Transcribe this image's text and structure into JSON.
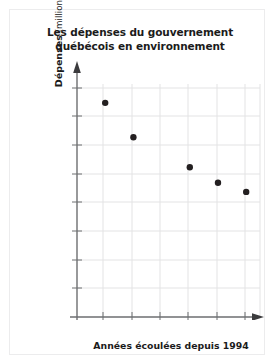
{
  "figure": {
    "title_line_1": "Les dépenses du gouvernement",
    "title_line_2": "québécois en environnement",
    "y_axis_label_strong": "Dépenses",
    "y_axis_label_units": " (millions $)",
    "x_axis_label": "Années écoulées depuis 1994",
    "origin_label": "0"
  },
  "colors": {
    "marker": "#231f20",
    "axis": "#6d6e70",
    "grid": "#e3e3e4",
    "tick_label": "#6d6e70",
    "title": "#1b1b1b",
    "card_border": "#ececed",
    "background": "#ffffff"
  },
  "chart_data": {
    "type": "scatter",
    "title": "Les dépenses du gouvernement québécois en environnement",
    "xlabel": "Années écoulées depuis 1994",
    "ylabel": "Dépenses (millions $)",
    "xlim": [
      0,
      6.5
    ],
    "ylim": [
      0,
      850
    ],
    "grid": true,
    "legend": "none",
    "x_ticks": [
      0,
      1,
      2,
      3,
      4,
      5,
      6
    ],
    "x_tick_labels": [
      "0",
      "1",
      "2",
      "3",
      "4",
      "5",
      "6"
    ],
    "y_ticks": [
      100,
      200,
      300,
      400,
      500,
      600,
      700,
      800
    ],
    "y_tick_labels": [
      "100",
      "200",
      "300",
      "400",
      "500",
      "600",
      "700",
      "800"
    ],
    "x": [
      1,
      2,
      4,
      5,
      6
    ],
    "values": [
      748,
      628,
      523,
      469,
      437
    ],
    "points": [
      {
        "x": 1,
        "y": 748
      },
      {
        "x": 2,
        "y": 628
      },
      {
        "x": 4,
        "y": 523
      },
      {
        "x": 5,
        "y": 469
      },
      {
        "x": 6,
        "y": 437
      }
    ]
  }
}
